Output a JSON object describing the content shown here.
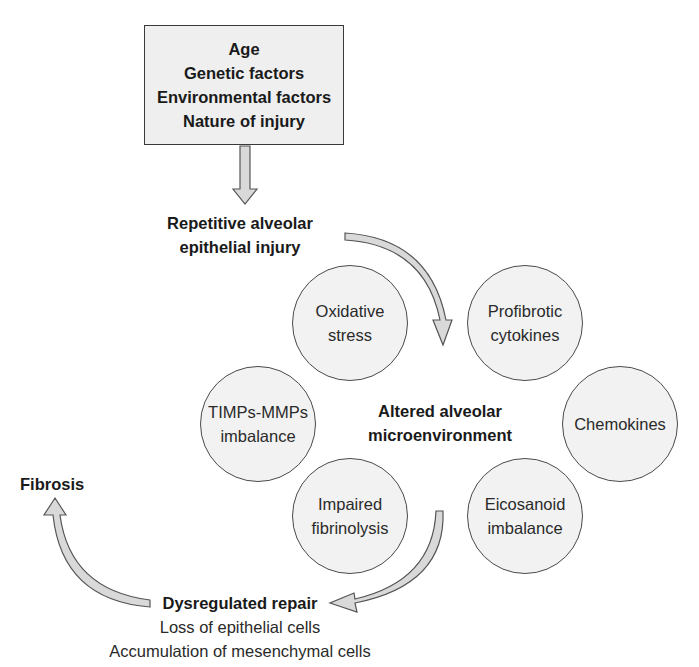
{
  "diagram": {
    "risk_factors_box": {
      "lines": [
        "Age",
        "Genetic factors",
        "Environmental factors",
        "Nature of injury"
      ]
    },
    "injury_label": {
      "lines": [
        "Repetitive alveolar",
        "epithelial injury"
      ]
    },
    "center_label": {
      "lines": [
        "Altered alveolar",
        "microenvironment"
      ]
    },
    "circles": [
      {
        "id": "oxidative-stress",
        "lines": [
          "Oxidative",
          "stress"
        ]
      },
      {
        "id": "profibrotic-cytokines",
        "lines": [
          "Profibrotic",
          "cytokines"
        ]
      },
      {
        "id": "timps-mmps-imbalance",
        "lines": [
          "TIMPs-MMPs",
          "imbalance"
        ]
      },
      {
        "id": "chemokines",
        "lines": [
          "Chemokines"
        ]
      },
      {
        "id": "impaired-fibrinolysis",
        "lines": [
          "Impaired",
          "fibrinolysis"
        ]
      },
      {
        "id": "eicosanoid-imbalance",
        "lines": [
          "Eicosanoid",
          "imbalance"
        ]
      }
    ],
    "repair_label": {
      "title": "Dysregulated repair",
      "details": [
        "Loss of epithelial cells",
        "Accumulation of mesenchymal cells"
      ]
    },
    "outcome_label": "Fibrosis",
    "colors": {
      "arrow_fill": "#d9d9d9",
      "arrow_stroke": "#555555",
      "circle_fill": "#f2f2f2",
      "box_fill": "#efefef"
    }
  }
}
